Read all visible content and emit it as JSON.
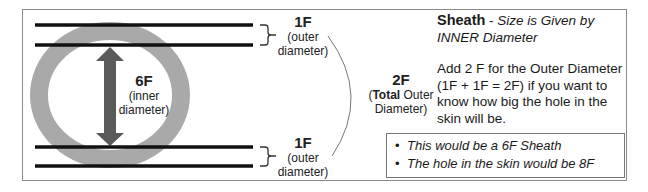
{
  "diagram": {
    "colors": {
      "ring": "#a9a9a9",
      "arrow": "#5a5a5a",
      "lines": "#111111",
      "frame": "#8a8a8a"
    },
    "top_label": {
      "value": "1F",
      "desc_line1": "(outer",
      "desc_line2": "diameter)"
    },
    "bottom_label": {
      "value": "1F",
      "desc_line1": "(outer",
      "desc_line2": "diameter)"
    },
    "inner_label": {
      "value": "6F",
      "desc_line1": "(inner",
      "desc_line2": "diameter)"
    },
    "total_label": {
      "value": "2F",
      "desc_bold": "Total",
      "desc_rest": " Outer",
      "desc_line2": "Diameter)",
      "desc_open": "("
    }
  },
  "text": {
    "title_bold": "Sheath",
    "title_sep": " - ",
    "title_italic": "Size is Given by INNER Diameter",
    "paragraph": "Add 2 F for the Outer Diameter (1F + 1F = 2F) if you want to know how big the hole in the skin will be."
  },
  "note": {
    "bullet": "•",
    "items": [
      "This would be a 6F Sheath",
      "The hole in the skin would be 8F"
    ]
  }
}
